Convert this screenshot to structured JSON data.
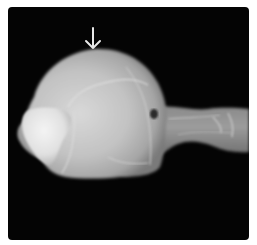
{
  "figure": {
    "type": "radiograph",
    "background_color": "#040404",
    "frame_color": "#ffffff",
    "annotation": {
      "icon": "arrow-down-icon",
      "color": "#e8e8e8",
      "points_to": "top of skull dome"
    }
  }
}
